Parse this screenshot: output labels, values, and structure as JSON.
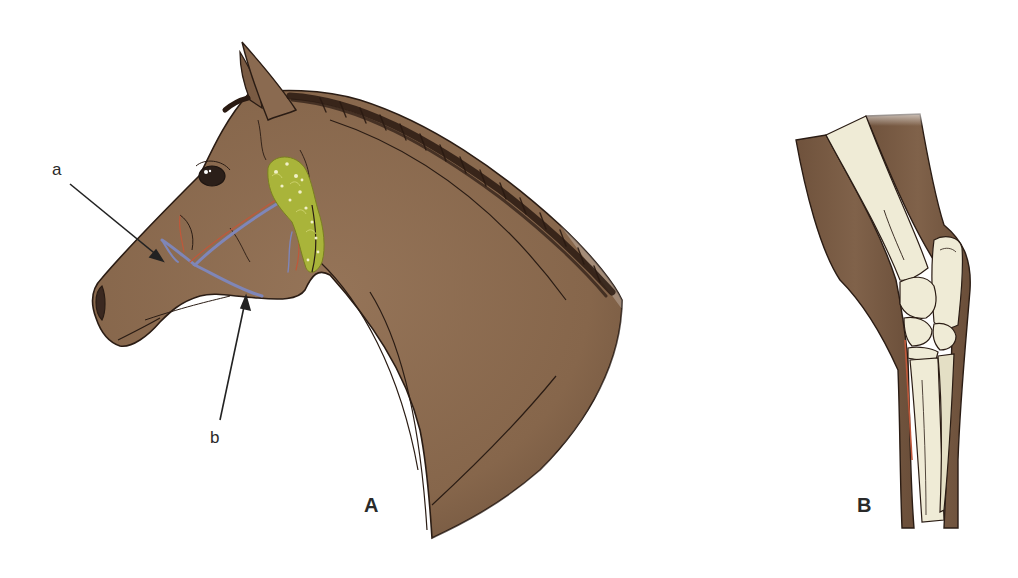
{
  "figure": {
    "panels": [
      {
        "id": "A",
        "label": "A",
        "subject": "horse head and neck, lateral view",
        "callouts": [
          {
            "id": "a",
            "label": "a"
          },
          {
            "id": "b",
            "label": "b"
          }
        ]
      },
      {
        "id": "B",
        "label": "B",
        "subject": "horse carpus (knee) with skeletal bones, lateral view"
      }
    ],
    "colors": {
      "coat": "#8b6a4e",
      "coat_dark": "#6e5039",
      "leg_coat": "#7a5a42",
      "mane": "#2a1a12",
      "outline": "#2a1c14",
      "vein": "#7f86b8",
      "artery": "#c0583a",
      "gland": "#a9b43a",
      "gland_highlight": "#f1f0c8",
      "bone": "#efebd6",
      "bone_shade": "#d9d4b8",
      "label_text": "#2a2a2a",
      "background": "#ffffff"
    }
  }
}
